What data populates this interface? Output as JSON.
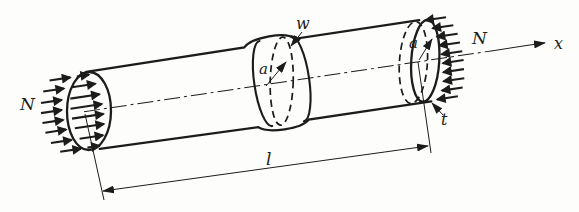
{
  "figure": {
    "kind": "cylindrical-shell-axial-load-diagram",
    "colors": {
      "ink": "#1c1c1c",
      "background": "#fdfdfb"
    },
    "labels": {
      "force_left": "N",
      "force_right": "N",
      "axis": "x",
      "bulge_displacement": "w",
      "radius_mid": "a",
      "radius_end": "a",
      "wall_thickness": "t",
      "length": "l"
    }
  }
}
